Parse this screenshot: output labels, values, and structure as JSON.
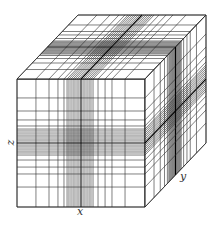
{
  "figure": {
    "type": "nonuniform-3d-grid-cube",
    "axes": {
      "x": "x",
      "y": "y",
      "z": "z"
    },
    "front_face": {
      "left": 17,
      "top": 79,
      "right": 145,
      "bottom": 207
    },
    "depth_offset": {
      "dx": 61,
      "dy": -64
    },
    "grid_fractions": [
      0.0,
      0.148,
      0.25,
      0.32,
      0.367,
      0.391,
      0.406,
      0.422,
      0.438,
      0.453,
      0.469,
      0.484,
      0.5,
      0.516,
      0.531,
      0.547,
      0.563,
      0.578,
      0.594,
      0.633,
      0.688,
      0.742,
      0.844,
      1.0
    ],
    "center_fraction": 0.5,
    "line_color": "#2a2a2a",
    "center_line_color": "#000000",
    "background": "#ffffff"
  }
}
